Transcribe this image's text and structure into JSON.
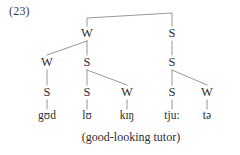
{
  "example": {
    "number_label": "(23)",
    "gloss": "(good-looking tutor)"
  },
  "colors": {
    "ink": "#2e2e2e",
    "line": "#8c8c8c",
    "background": "#ffffff"
  },
  "tree": {
    "type": "metrical-grid-tree",
    "root": {
      "label": "",
      "x": 130,
      "y": 18
    },
    "levels": [
      {
        "level": 1,
        "y": 33,
        "nodes": [
          {
            "id": "n1",
            "label": "W",
            "x": 87
          },
          {
            "id": "n2",
            "label": "S",
            "x": 172
          }
        ]
      },
      {
        "level": 2,
        "y": 62,
        "nodes": [
          {
            "id": "n3",
            "label": "W",
            "x": 47
          },
          {
            "id": "n4",
            "label": "S",
            "x": 87
          },
          {
            "id": "n5",
            "label": "S",
            "x": 172
          }
        ]
      },
      {
        "level": 3,
        "y": 92,
        "nodes": [
          {
            "id": "n6",
            "label": "S",
            "x": 47
          },
          {
            "id": "n7",
            "label": "S",
            "x": 87
          },
          {
            "id": "n8",
            "label": "W",
            "x": 127
          },
          {
            "id": "n9",
            "label": "S",
            "x": 172
          },
          {
            "id": "n10",
            "label": "W",
            "x": 207
          }
        ]
      }
    ],
    "terminals": {
      "y": 115,
      "items": [
        {
          "id": "t1",
          "text": "gʊd",
          "x": 47
        },
        {
          "id": "t2",
          "text": "lʊ",
          "x": 87
        },
        {
          "id": "t3",
          "text": "kɪŋ",
          "x": 127
        },
        {
          "id": "t4",
          "text": "tju:",
          "x": 172
        },
        {
          "id": "t5",
          "text": "tə",
          "x": 207
        }
      ]
    },
    "edges": [
      {
        "from": "root",
        "to": "n1"
      },
      {
        "from": "root",
        "to": "n2"
      },
      {
        "from": "n1",
        "to": "n3"
      },
      {
        "from": "n1",
        "to": "n4"
      },
      {
        "from": "n2",
        "to": "n5"
      },
      {
        "from": "n3",
        "to": "n6"
      },
      {
        "from": "n4",
        "to": "n7"
      },
      {
        "from": "n4",
        "to": "n8"
      },
      {
        "from": "n5",
        "to": "n9"
      },
      {
        "from": "n5",
        "to": "n10"
      },
      {
        "from": "n6",
        "to": "t1"
      },
      {
        "from": "n7",
        "to": "t2"
      },
      {
        "from": "n8",
        "to": "t3"
      },
      {
        "from": "n9",
        "to": "t4"
      },
      {
        "from": "n10",
        "to": "t5"
      }
    ]
  }
}
